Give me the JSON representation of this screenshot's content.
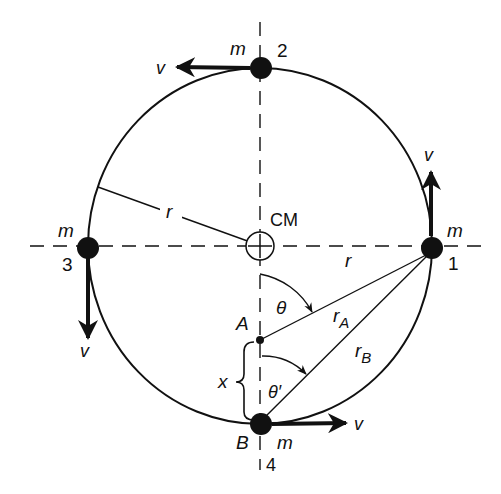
{
  "diagram": {
    "colors": {
      "ink": "#111111",
      "background": "#ffffff"
    },
    "center_label": "CM",
    "radius_label": "r",
    "radius_label_horizontal": "r",
    "masses": [
      {
        "id": "1",
        "number": "1",
        "mass_label": "m",
        "velocity_label": "v",
        "velocity_direction": "up"
      },
      {
        "id": "2",
        "number": "2",
        "mass_label": "m",
        "velocity_label": "v",
        "velocity_direction": "left"
      },
      {
        "id": "3",
        "number": "3",
        "mass_label": "m",
        "velocity_label": "v",
        "velocity_direction": "down"
      },
      {
        "id": "4",
        "number": "4",
        "mass_label": "m",
        "velocity_label": "v",
        "velocity_direction": "right"
      }
    ],
    "points": {
      "A": "A",
      "B": "B"
    },
    "distances": {
      "rA": {
        "base": "r",
        "sub": "A"
      },
      "rB": {
        "base": "r",
        "sub": "B"
      },
      "x": "x"
    },
    "angles": {
      "theta": "θ",
      "theta_prime": "θ′"
    }
  }
}
